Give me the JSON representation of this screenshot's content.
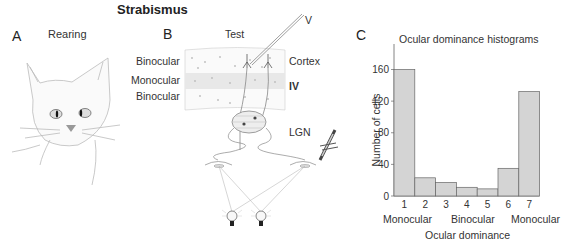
{
  "figure": {
    "title": "Strabismus",
    "panels": {
      "A": {
        "letter": "A",
        "label": "Rearing"
      },
      "B": {
        "letter": "B",
        "label": "Test",
        "electrode_label": "V",
        "layer_labels": [
          "Binocular",
          "Monocular",
          "Binocular"
        ],
        "cortex_label": "Cortex",
        "layer_iv_label": "IV",
        "lgn_label": "LGN"
      },
      "C": {
        "letter": "C"
      }
    }
  },
  "chart_data": {
    "type": "bar",
    "title": "Ocular dominance histograms",
    "xlabel": "Ocular dominance",
    "ylabel": "Number of cells",
    "categories": [
      "1",
      "2",
      "3",
      "4",
      "5",
      "6",
      "7"
    ],
    "values": [
      160,
      23,
      17,
      11,
      9,
      35,
      132
    ],
    "category_group_labels": [
      "Monocular",
      "Binocular",
      "Monocular"
    ],
    "yticks": [
      0,
      40,
      80,
      120,
      160
    ],
    "ylim": [
      0,
      190
    ],
    "grid": false,
    "bar_color": "#d4d4d4",
    "bar_edge_color": "#666666"
  }
}
